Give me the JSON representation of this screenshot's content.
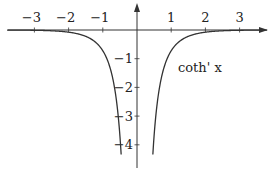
{
  "chart_data": {
    "type": "line",
    "title": "",
    "xlabel": "",
    "ylabel": "",
    "function": "coth'(x) = -1/sinh^2(x)",
    "curve_label": "coth' x",
    "xlim": [
      -3.8,
      3.8
    ],
    "ylim": [
      -4.5,
      0.9
    ],
    "x_ticks": [
      -3,
      -2,
      -1,
      1,
      2,
      3
    ],
    "x_tick_labels": [
      "−3",
      "−2",
      "−1",
      "1",
      "2",
      "3"
    ],
    "y_ticks": [
      -1,
      -2,
      -3,
      -4
    ],
    "y_tick_labels": [
      "−1",
      "−2",
      "−3",
      "−4"
    ],
    "grid": false,
    "legend": "none",
    "series": [
      {
        "name": "coth' x",
        "branches": [
          {
            "x": [
              -3.8,
              -3,
              -2,
              -1.5,
              -1,
              -0.8,
              -0.6,
              -0.5,
              -0.45
            ],
            "y": [
              -0.002,
              -0.01,
              -0.076,
              -0.22,
              -0.724,
              -1.27,
              -2.8,
              -3.69,
              -4.5
            ]
          },
          {
            "x": [
              0.45,
              0.5,
              0.6,
              0.8,
              1,
              1.5,
              2,
              3,
              3.8
            ],
            "y": [
              -4.5,
              -3.69,
              -2.8,
              -1.27,
              -0.724,
              -0.22,
              -0.076,
              -0.01,
              -0.002
            ]
          }
        ]
      }
    ],
    "colors": {
      "axis": "#333333",
      "curve": "#333333",
      "text": "#222222"
    }
  }
}
